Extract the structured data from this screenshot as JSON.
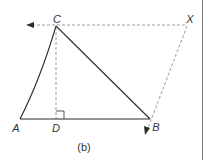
{
  "figure": {
    "caption": "(b)",
    "colors": {
      "solid_line": "#2b2b2b",
      "dashed_line": "#9a9a9a",
      "label_text": "#333333",
      "border": "#7a7a7a"
    },
    "points": {
      "A": {
        "label": "A",
        "x": 20,
        "y": 119
      },
      "B": {
        "label": "B",
        "x": 150,
        "y": 119
      },
      "C": {
        "label": "C",
        "x": 56,
        "y": 26
      },
      "D": {
        "label": "D",
        "x": 56,
        "y": 119
      },
      "X": {
        "label": "X",
        "x": 187,
        "y": 26
      }
    },
    "solid_segments": [
      "AC",
      "CB",
      "AB"
    ],
    "dashed_segments": [
      "CD",
      "CX",
      "XB",
      "C-left-arrow"
    ],
    "right_angle_at": "D",
    "arrows": [
      {
        "name": "left-arrow",
        "direction": "left",
        "tip": {
          "x": 27,
          "y": 25
        }
      },
      {
        "name": "down-arrow",
        "direction": "down-left",
        "tip": {
          "x": 146,
          "y": 134
        }
      }
    ]
  }
}
